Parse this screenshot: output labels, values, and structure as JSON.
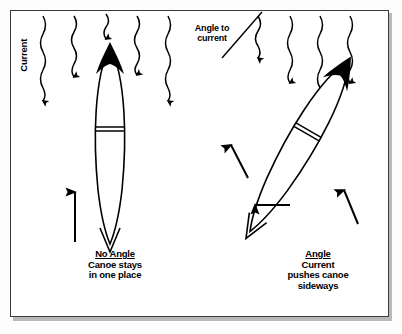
{
  "figure": {
    "name": "canoe-ferry-angle-diagram",
    "background_color": "#ffffff",
    "frame_border_color": "#3a3a3a",
    "shadow_color": "#b9b9b9",
    "ink_color": "#000000"
  },
  "labels": {
    "current": "Current",
    "angle_to_current_line1": "Angle to",
    "angle_to_current_line2": "current"
  },
  "captions": {
    "left": {
      "title": "No Angle",
      "line1": "Canoe stays",
      "line2": "in one place"
    },
    "right": {
      "title": "Angle",
      "line1": "Current",
      "line2": "pushes canoe",
      "line3": "sideways"
    }
  },
  "diagram": {
    "current_arrows_count": 9,
    "canoes": [
      {
        "name": "canoe-left-no-angle",
        "orientation_degrees": 0,
        "bow": "filled-black",
        "thwart": "double-line"
      },
      {
        "name": "canoe-right-angled",
        "orientation_degrees": 30,
        "bow": "filled-black",
        "thwart": "double-line"
      }
    ],
    "motion_arrows": [
      {
        "name": "arrow-left-canoe-upstream",
        "direction": "up"
      },
      {
        "name": "arrow-right-canoe-paddle",
        "direction": "up-left"
      },
      {
        "name": "arrow-right-canoe-sideways-drift",
        "direction": "left"
      },
      {
        "name": "arrow-right-canoe-stern-push",
        "direction": "up-right"
      }
    ]
  }
}
